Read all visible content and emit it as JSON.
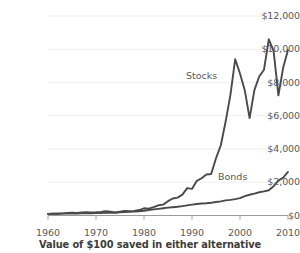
{
  "chart_data": {
    "type": "line",
    "title": "",
    "caption": "Value of $100 saved in either alternative",
    "xlabel": "",
    "ylabel": "",
    "xlim": [
      1960,
      2010
    ],
    "ylim": [
      0,
      12000
    ],
    "grid": true,
    "legend_position": "inline-annotation",
    "x_ticks": [
      "1960",
      "1970",
      "1980",
      "1990",
      "2000",
      "2010"
    ],
    "x_tick_values": [
      1960,
      1970,
      1980,
      1990,
      2000,
      2010
    ],
    "y_ticks": [
      "$0",
      "$2,000",
      "$4,000",
      "$6,000",
      "$8,000",
      "$10,000",
      "$12,000"
    ],
    "y_tick_values": [
      0,
      2000,
      4000,
      6000,
      8000,
      10000,
      12000
    ],
    "line_color": "#4a4a4a",
    "grid_color": "#eeeeee",
    "axis_color": "#9a9a9a",
    "text_color": "#58595b",
    "series": [
      {
        "name": "Stocks",
        "label_x": 1993,
        "label_y": 8400,
        "x": [
          1960,
          1961,
          1962,
          1963,
          1964,
          1965,
          1966,
          1967,
          1968,
          1969,
          1970,
          1971,
          1972,
          1973,
          1974,
          1975,
          1976,
          1977,
          1978,
          1979,
          1980,
          1981,
          1982,
          1983,
          1984,
          1985,
          1986,
          1987,
          1988,
          1989,
          1990,
          1991,
          1992,
          1993,
          1994,
          1995,
          1996,
          1997,
          1998,
          1999,
          2000,
          2001,
          2002,
          2003,
          2004,
          2005,
          2006,
          2007,
          2008,
          2009,
          2010
        ],
        "values": [
          100,
          112,
          102,
          125,
          146,
          164,
          147,
          182,
          202,
          185,
          192,
          220,
          262,
          224,
          165,
          226,
          280,
          260,
          277,
          328,
          434,
          413,
          502,
          615,
          654,
          861,
          1022,
          1075,
          1253,
          1650,
          1599,
          2085,
          2243,
          2468,
          2500,
          3438,
          4226,
          5636,
          7245,
          9400,
          8540,
          7525,
          5860,
          7540,
          8360,
          8770,
          10600,
          9900,
          7230,
          8900,
          9950
        ]
      },
      {
        "name": "Bonds",
        "label_x": 1998,
        "label_y": 2500,
        "x": [
          1960,
          1961,
          1962,
          1963,
          1964,
          1965,
          1966,
          1967,
          1968,
          1969,
          1970,
          1971,
          1972,
          1973,
          1974,
          1975,
          1976,
          1977,
          1978,
          1979,
          1980,
          1981,
          1982,
          1983,
          1984,
          1985,
          1986,
          1987,
          1988,
          1989,
          1990,
          1991,
          1992,
          1993,
          1994,
          1995,
          1996,
          1997,
          1998,
          1999,
          2000,
          2001,
          2002,
          2003,
          2004,
          2005,
          2006,
          2007,
          2008,
          2009,
          2010
        ],
        "values": [
          100,
          103,
          108,
          111,
          115,
          119,
          123,
          127,
          132,
          138,
          147,
          153,
          158,
          169,
          184,
          195,
          205,
          216,
          232,
          256,
          286,
          330,
          365,
          400,
          438,
          471,
          500,
          527,
          562,
          610,
          657,
          694,
          718,
          738,
          770,
          810,
          852,
          912,
          940,
          985,
          1044,
          1163,
          1250,
          1320,
          1400,
          1450,
          1520,
          1760,
          2100,
          2280,
          2620
        ]
      }
    ]
  },
  "axes": {
    "y_labels": [
      "$12,000",
      "$10,000",
      "$8,000",
      "$6,000",
      "$4,000",
      "$2,000",
      "$0"
    ],
    "x_labels": [
      "1960",
      "1970",
      "1980",
      "1990",
      "2000",
      "2010"
    ]
  },
  "annotations": {
    "stocks": "Stocks",
    "bonds": "Bonds"
  },
  "caption": {
    "text": "Value of $100 saved in either alternative"
  }
}
